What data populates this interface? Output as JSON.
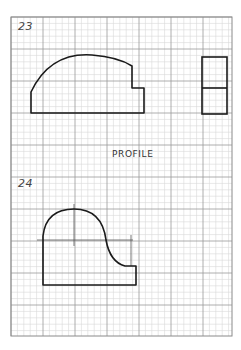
{
  "worksheet": {
    "grid": {
      "left": 11,
      "top": 17,
      "right": 232,
      "bottom": 336,
      "major_spacing": 32,
      "minor_divisions": 5,
      "major_color": "#9a9a9a",
      "minor_color": "#d8d8d8",
      "border_color": "#8a8a8a"
    },
    "problems": [
      {
        "number": "23",
        "views": [
          "front-view",
          "side-view"
        ]
      },
      {
        "number": "24",
        "views": [
          "front-view"
        ]
      }
    ],
    "caption": "PROFILE",
    "line_color": "#1a1a1a"
  }
}
